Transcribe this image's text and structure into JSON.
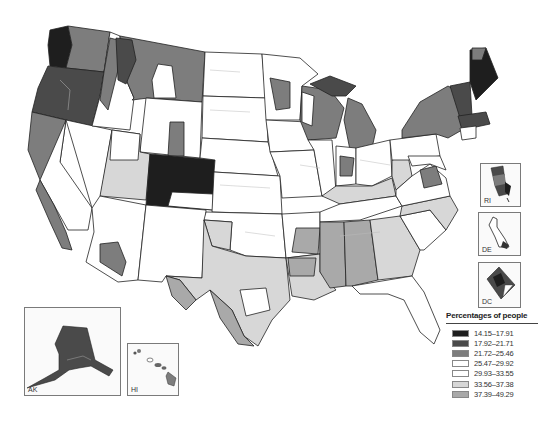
{
  "map": {
    "subject": "United States choropleth map by region",
    "legend": {
      "title": "Percentages of people",
      "classes": [
        {
          "label": "14.15–17.91",
          "color": "#1e1e1e"
        },
        {
          "label": "17.92–21.71",
          "color": "#4a4a4a"
        },
        {
          "label": "21.72–25.46",
          "color": "#7d7d7d"
        },
        {
          "label": "25.47–29.92",
          "color": "#ffffff"
        },
        {
          "label": "29.93–33.55",
          "color": "#ffffff"
        },
        {
          "label": "33.56–37.38",
          "color": "#d7d7d7"
        },
        {
          "label": "37.39–49.29",
          "color": "#a9a9a9"
        }
      ]
    },
    "insets": [
      {
        "id": "AK",
        "label": "AK"
      },
      {
        "id": "HI",
        "label": "HI"
      },
      {
        "id": "RI",
        "label": "RI"
      },
      {
        "id": "DE",
        "label": "DE"
      },
      {
        "id": "DC",
        "label": "DC"
      }
    ]
  }
}
